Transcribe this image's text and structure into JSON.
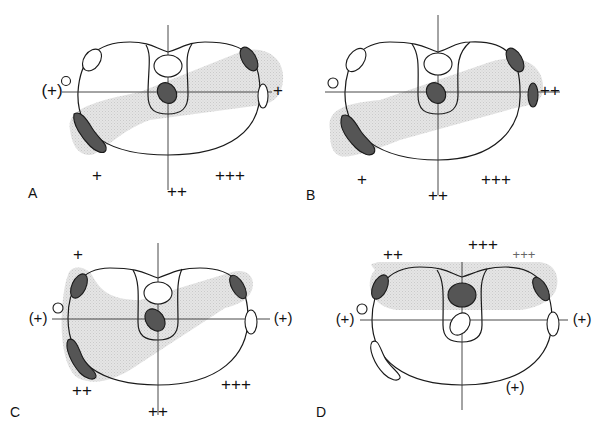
{
  "figure": {
    "colors": {
      "outline": "#1a1a1a",
      "shading": "#d9d9d9",
      "dark_fill": "#555555",
      "open_fill": "#ffffff"
    },
    "panels": [
      {
        "id": "A",
        "letter": "A",
        "labels": {
          "left": "(+)",
          "right": "+",
          "bottom_left": "+",
          "bottom_center": "++",
          "bottom_right": "+++"
        },
        "markers": {
          "upper_left": "open",
          "upper_right": "dark",
          "right_mid": "open",
          "lower_left": "dark",
          "center_top": "open",
          "center_lower": "dark",
          "outer_circle": "open"
        }
      },
      {
        "id": "B",
        "letter": "B",
        "labels": {
          "right": "++",
          "bottom_left": "+",
          "bottom_center": "++",
          "bottom_right": "+++"
        },
        "markers": {
          "upper_left": "open",
          "upper_right": "dark",
          "right_mid": "dark",
          "lower_left": "dark",
          "center_top": "open",
          "center_lower": "dark",
          "outer_circle": "open"
        }
      },
      {
        "id": "C",
        "letter": "C",
        "labels": {
          "top_left": "+",
          "left": "(+)",
          "right": "(+)",
          "bottom_left": "++",
          "bottom_center": "++",
          "bottom_right": "+++"
        },
        "markers": {
          "upper_left": "dark",
          "upper_right": "dark",
          "right_mid": "open",
          "lower_left": "dark",
          "center_top": "open",
          "center_lower": "dark",
          "outer_circle": "open"
        }
      },
      {
        "id": "D",
        "letter": "D",
        "labels": {
          "top_left": "++",
          "top_center": "+++",
          "top_right": "+++",
          "left": "(+)",
          "right": "(+)",
          "bottom_right": "(+)"
        },
        "markers": {
          "upper_left": "dark",
          "upper_right": "dark",
          "right_mid": "open",
          "lower_left": "open",
          "center_top": "dark",
          "center_lower": "open",
          "outer_circle": "open"
        }
      }
    ]
  }
}
